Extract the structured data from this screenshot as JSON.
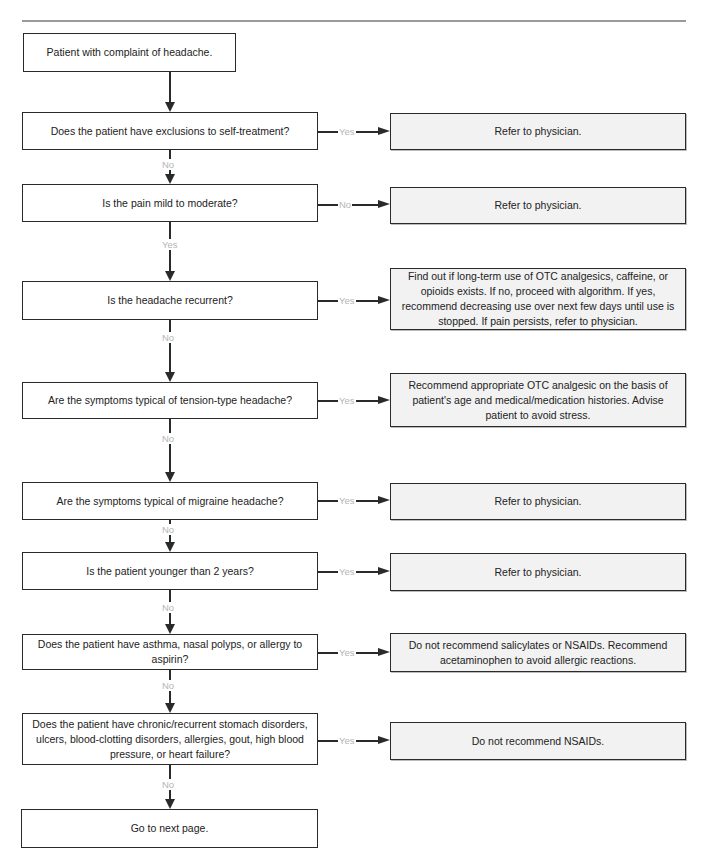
{
  "flowchart": {
    "start": "Patient with complaint of headache.",
    "end": "Go to next page.",
    "labels": {
      "yes": "Yes",
      "no": "No"
    },
    "steps": [
      {
        "question": "Does the patient have exclusions to self-treatment?",
        "branch": "Yes",
        "action": "Refer to physician.",
        "continue": "No"
      },
      {
        "question": "Is the pain mild to moderate?",
        "branch": "No",
        "action": "Refer to physician.",
        "continue": "Yes"
      },
      {
        "question": "Is the headache recurrent?",
        "branch": "Yes",
        "action": "Find out if long-term use of OTC analgesics, caffeine, or opioids exists. If no, proceed with algorithm. If yes, recommend decreasing use over next few days until use is stopped. If pain persists, refer to physician.",
        "continue": "No"
      },
      {
        "question": "Are the symptoms typical of tension-type headache?",
        "branch": "Yes",
        "action": "Recommend appropriate OTC analgesic on the basis of patient's age and medical/medication histories. Advise patient to avoid stress.",
        "continue": "No"
      },
      {
        "question": "Are the symptoms typical of migraine headache?",
        "branch": "Yes",
        "action": "Refer to physician.",
        "continue": "No"
      },
      {
        "question": "Is the patient younger than 2 years?",
        "branch": "Yes",
        "action": "Refer to physician.",
        "continue": "No"
      },
      {
        "question": "Does the patient have asthma, nasal polyps, or allergy to aspirin?",
        "branch": "Yes",
        "action": "Do not recommend salicylates or NSAIDs. Recommend acetaminophen to avoid allergic reactions.",
        "continue": "No"
      },
      {
        "question": "Does the patient have chronic/recurrent stomach disorders, ulcers, blood-clotting disorders, allergies, gout, high blood pressure, or heart failure?",
        "branch": "Yes",
        "action": "Do not recommend NSAIDs.",
        "continue": "No"
      }
    ]
  },
  "colors": {
    "line": "#2a2a2a",
    "action_fill": "#f2f2f2",
    "label": "#b5b5b5",
    "rule": "#9a9a9a"
  }
}
